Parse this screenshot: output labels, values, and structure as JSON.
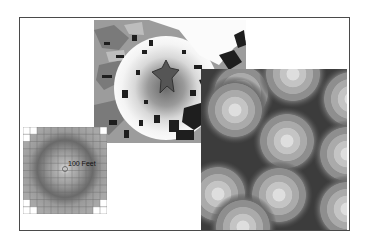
{
  "figure": {
    "panels": [
      {
        "id": "landcover-map",
        "description": "Classified land-cover map with distance gradient around a central star-shaped feature"
      },
      {
        "id": "buffer-rings",
        "description": "Overlapping concentric distance rings around multiple points"
      },
      {
        "id": "raster-grid",
        "description": "Raster grid showing radial distance surface from a center cell"
      }
    ],
    "grid_label": "100 Feet",
    "colors": {
      "frame": "#4a4a4a",
      "dark": "#1e1e1e",
      "mid": "#8a8a8a",
      "light": "#d6d6d6",
      "background": "#ffffff"
    }
  }
}
